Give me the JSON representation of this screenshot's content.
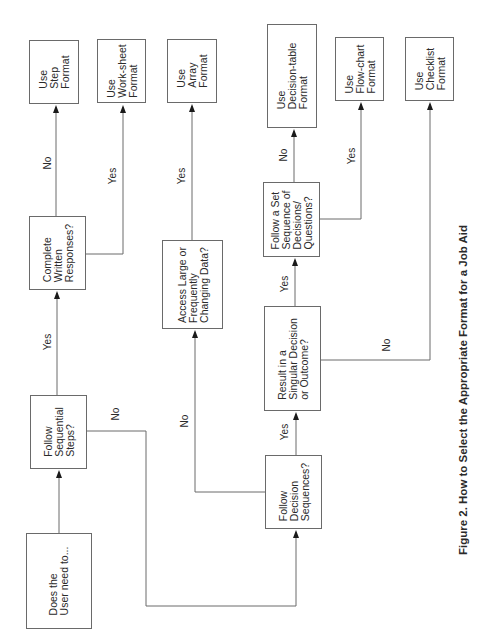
{
  "diagram": {
    "title": "Figure 2. How to Select the Appropriate Format for a Job Aid",
    "orientation": "rotated 90° counter-clockwise",
    "nodes": {
      "start": "Does the\nUser need to...",
      "sequential_steps": "Follow\nSequential\nSteps?",
      "written_responses": "Complete\nWritten\nResponses?",
      "step_format": "Use\nStep\nFormat",
      "worksheet_format": "Use\nWork-sheet\nFormat",
      "decision_sequences": "Follow\nDecision\nSequences?",
      "large_data": "Access Large or\nFrequently\nChanging Data?",
      "array_format": "Use\nArray\nFormat",
      "singular_decision": "Result in a\nSingular Decision\nor Outcome?",
      "set_sequence": "Follow a Set\nSequence of\nDecisions/\nQuestions?",
      "decision_table_format": "Use\nDecision-table\nFormat",
      "flowchart_format": "Use\nFlow-chart\nFormat",
      "checklist_format": "Use\nChecklist\nFormat"
    },
    "edge_labels": {
      "sequential_yes": "Yes",
      "sequential_no": "No",
      "written_no": "No",
      "written_yes": "Yes",
      "decision_seq_yes": "Yes",
      "decision_seq_no": "No",
      "large_data_yes": "Yes",
      "singular_yes": "Yes",
      "singular_no": "No",
      "set_sequence_no": "No",
      "set_sequence_yes": "Yes"
    },
    "edges": [
      {
        "from": "start",
        "to": "sequential_steps",
        "label": ""
      },
      {
        "from": "sequential_steps",
        "to": "written_responses",
        "label": "Yes"
      },
      {
        "from": "sequential_steps",
        "to": "decision_sequences",
        "label": "No"
      },
      {
        "from": "written_responses",
        "to": "step_format",
        "label": "No"
      },
      {
        "from": "written_responses",
        "to": "worksheet_format",
        "label": "Yes"
      },
      {
        "from": "decision_sequences",
        "to": "singular_decision",
        "label": "Yes"
      },
      {
        "from": "decision_sequences",
        "to": "large_data",
        "label": "No"
      },
      {
        "from": "large_data",
        "to": "array_format",
        "label": "Yes"
      },
      {
        "from": "singular_decision",
        "to": "set_sequence",
        "label": "Yes"
      },
      {
        "from": "singular_decision",
        "to": "checklist_format",
        "label": "No"
      },
      {
        "from": "set_sequence",
        "to": "decision_table_format",
        "label": "No"
      },
      {
        "from": "set_sequence",
        "to": "flowchart_format",
        "label": "Yes"
      }
    ]
  }
}
